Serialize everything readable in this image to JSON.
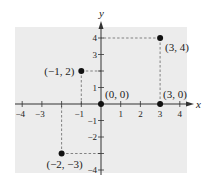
{
  "chart_data": {
    "type": "scatter",
    "title": "",
    "xlabel": "x",
    "ylabel": "y",
    "xlim": [
      -4.3,
      4.6
    ],
    "ylim": [
      -4.2,
      4.9
    ],
    "grid": false,
    "legend": null,
    "x_ticks": [
      -4,
      -3,
      -2,
      -1,
      1,
      2,
      3,
      4
    ],
    "x_tick_labels": [
      "−4",
      "−3",
      "",
      "−1",
      "1",
      "2",
      "3",
      "4"
    ],
    "y_ticks": [
      -4,
      -3,
      -2,
      -1,
      1,
      2,
      3,
      4
    ],
    "y_tick_labels": [
      "−4",
      "",
      "−2",
      "−1",
      "1",
      "",
      "3",
      "4"
    ],
    "points": [
      {
        "x": 3,
        "y": 4,
        "label": "(3, 4)",
        "guides": true
      },
      {
        "x": -1,
        "y": 2,
        "label": "(−1, 2)",
        "guides": true
      },
      {
        "x": 0,
        "y": 0,
        "label": "(0, 0)",
        "guides": false
      },
      {
        "x": 3,
        "y": 0,
        "label": "(3, 0)",
        "guides": false
      },
      {
        "x": -2,
        "y": -3,
        "label": "(−2, −3)",
        "guides": true
      }
    ]
  },
  "colors": {
    "panel": "#ececec",
    "axis": "#333333",
    "point": "#111111",
    "guide": "#555555"
  }
}
